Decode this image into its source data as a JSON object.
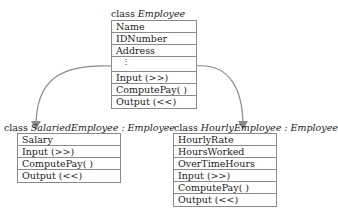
{
  "diagram": {
    "type": "class-inheritance",
    "base_class": {
      "keyword": "class",
      "name": "Employee",
      "members": [
        "Name",
        "IDNumber",
        "Address",
        "⋮",
        "Input (>>)",
        "ComputePay( )",
        "Output (<<)"
      ]
    },
    "derived_classes": [
      {
        "keyword": "class",
        "name": "SalariedEmployee : Employee",
        "members": [
          "Salary",
          "Input (>>)",
          "ComputePay( )",
          "Output (<<)"
        ]
      },
      {
        "keyword": "class",
        "name": "HourlyEmployee : Employee",
        "members": [
          "HourlyRate",
          "HoursWorked",
          "OverTimeHours",
          "Input (>>)",
          "ComputePay( )",
          "Output (<<)"
        ]
      }
    ],
    "arrow_color": "#8a8a8a"
  }
}
